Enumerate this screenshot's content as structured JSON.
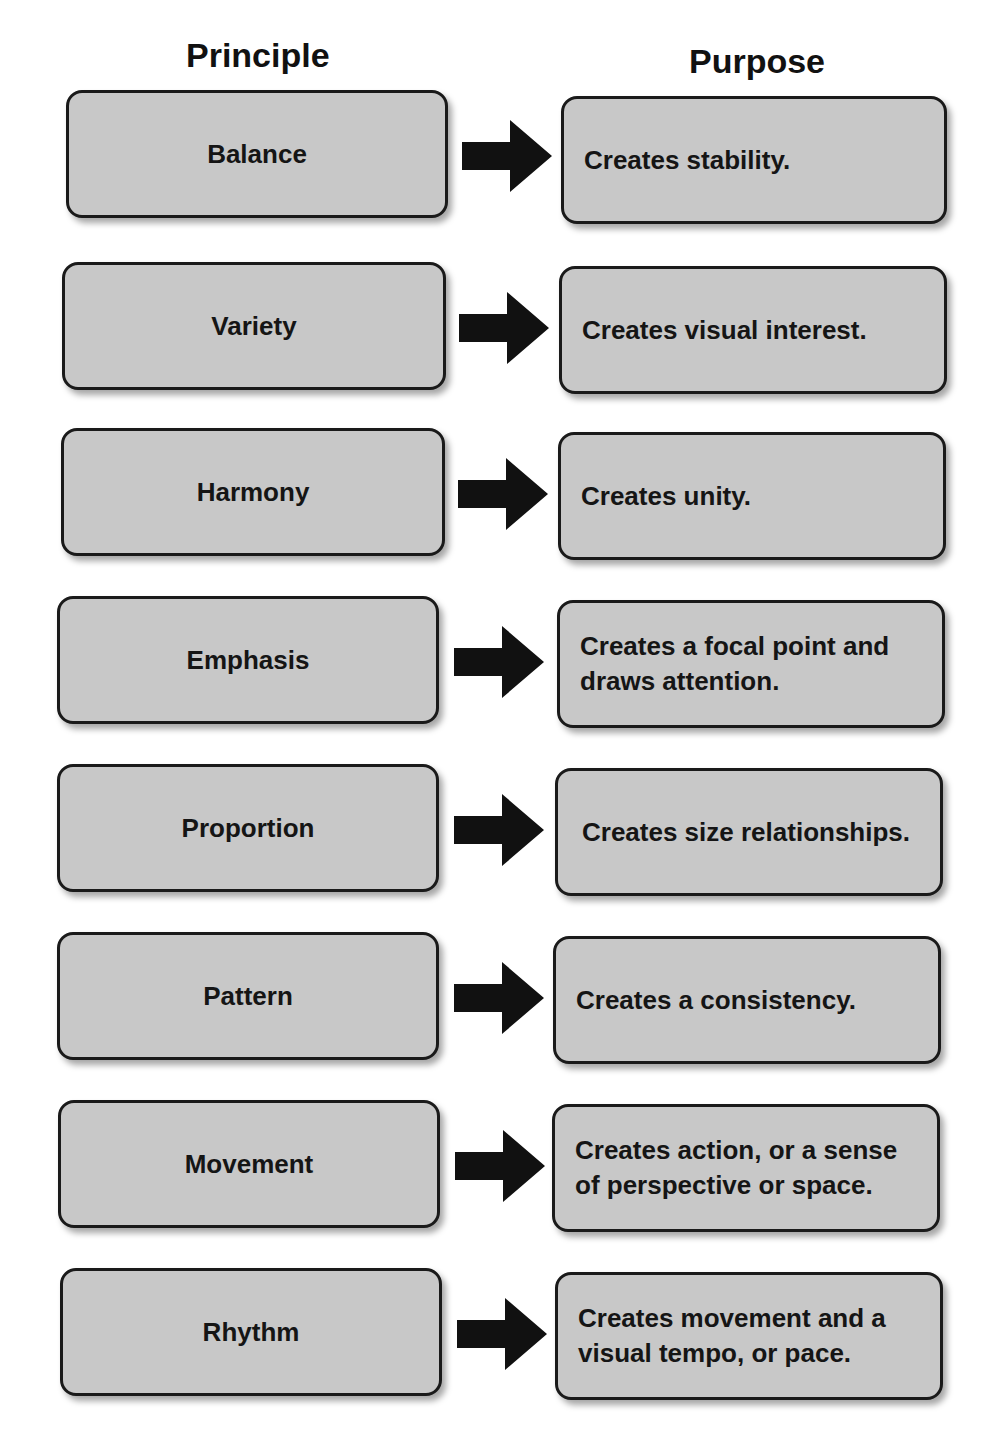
{
  "headers": {
    "principle": "Principle",
    "purpose": "Purpose"
  },
  "rows": [
    {
      "principle": "Balance",
      "purpose": "Creates stability."
    },
    {
      "principle": "Variety",
      "purpose": "Creates visual interest."
    },
    {
      "principle": "Harmony",
      "purpose": "Creates unity."
    },
    {
      "principle": "Emphasis",
      "purpose": "Creates a focal point and draws attention."
    },
    {
      "principle": "Proportion",
      "purpose": "Creates size relationships."
    },
    {
      "principle": "Pattern",
      "purpose": "Creates a consistency."
    },
    {
      "principle": "Movement",
      "purpose": "Creates action, or a sense of perspective or space."
    },
    {
      "principle": "Rhythm",
      "purpose": "Creates movement and a visual tempo, or pace."
    }
  ],
  "icons": {
    "connector": "right-arrow-icon"
  },
  "colors": {
    "box_fill": "#c8c8c8",
    "box_border": "#1a1a1a",
    "arrow": "#111111"
  }
}
